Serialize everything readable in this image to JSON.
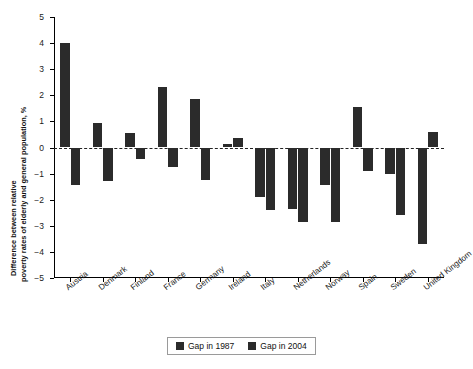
{
  "chart_data": {
    "type": "bar",
    "title": "",
    "xlabel": "",
    "ylabel": "Difference between relative poverty rates of elderly and general population, %",
    "ylabel_line1": "Difference between relative",
    "ylabel_line2": "poverty rates of elderly and general population, %",
    "ylim": [
      -5,
      5
    ],
    "yticks": [
      5,
      4,
      3,
      2,
      1,
      0,
      -1,
      -2,
      -3,
      -4,
      -5
    ],
    "ytick_labels": [
      "5",
      "4",
      "3",
      "2",
      "1",
      "0",
      "−1",
      "−2",
      "−3",
      "−4",
      "−5"
    ],
    "grid": false,
    "zero_reference_line": true,
    "legend_position": "bottom-center",
    "bar_color": "#2b2b2b",
    "categories": [
      "Austria",
      "Denmark",
      "Finland",
      "France",
      "Germany",
      "Ireland",
      "Italy",
      "Netherlands",
      "Norway",
      "Spain",
      "Sweden",
      "United Kingdom"
    ],
    "series": [
      {
        "name": "Gap in 1987",
        "values": [
          4.0,
          0.95,
          0.55,
          2.3,
          1.85,
          0.15,
          -1.9,
          -2.35,
          -1.45,
          1.55,
          -1.0,
          -3.7
        ]
      },
      {
        "name": "Gap in 2004",
        "values": [
          -1.45,
          -1.3,
          -0.45,
          -0.75,
          -1.25,
          0.35,
          -2.4,
          -2.85,
          -2.85,
          -0.9,
          -2.6,
          0.6
        ]
      }
    ]
  },
  "legend": {
    "items": [
      {
        "label": "Gap in 1987"
      },
      {
        "label": "Gap in 2004"
      }
    ]
  }
}
